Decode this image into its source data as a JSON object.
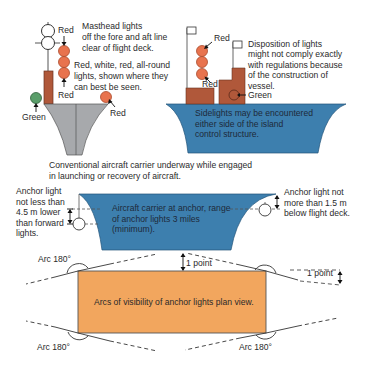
{
  "colors": {
    "hull_gray": "#a7a9ac",
    "hull_blue": "#3d7fae",
    "island_brown": "#b0583a",
    "light_red": "#e8734e",
    "light_green": "#5a9e6a",
    "deck_orange": "#f2a65e",
    "line": "#333333"
  },
  "underway": {
    "masthead_label": "Red",
    "masthead_note": [
      "Masthead lights",
      "off the fore and aft line",
      "clear of flight deck."
    ],
    "allround_note": [
      "Red, white, red, all-round",
      "lights, shown where they",
      "can best be seen."
    ],
    "lower_red_label": "Red",
    "green_label": "Green",
    "side_red_label": "Red",
    "side_view_top_red": "Red",
    "side_view_bottom_red": "Red",
    "disposition_note": [
      "Disposition of lights",
      "might not comply exactly",
      "with regulations because",
      "of the construction of",
      "vessel."
    ],
    "side_green_label": "Green",
    "sidelights_note": [
      "Sidelights may be encountered",
      "either side of the island",
      "control structure."
    ],
    "caption": [
      "Conventional aircraft carrier underway while engaged",
      "in launching or recovery of aircraft."
    ]
  },
  "anchor": {
    "left_note": [
      "Anchor light",
      "not less than",
      "4.5 m lower",
      "than forward",
      "lights."
    ],
    "right_note": [
      "Anchor light not",
      "more than 1.5 m",
      "below flight deck."
    ],
    "hull_note": [
      "Aircraft carrier at anchor, range",
      "of anchor lights 3 miles",
      "(minimum)."
    ]
  },
  "plan_view": {
    "title": "Arcs of visibility of anchor lights plan view.",
    "arc_top_left": "Arc 180°",
    "arc_bottom_left": "Arc 180°",
    "arc_bottom_right": "Arc 180°",
    "point_top": "1 point",
    "point_right": "1 point"
  }
}
